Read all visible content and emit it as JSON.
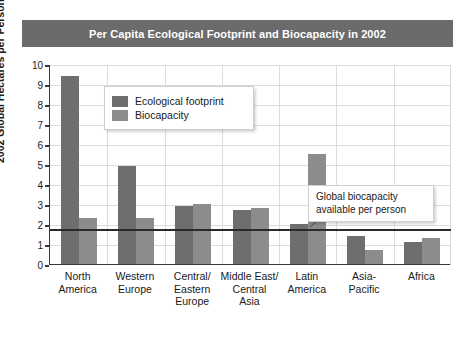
{
  "chart_data": {
    "type": "bar",
    "title": "Per Capita Ecological Footprint and Biocapacity in 2002",
    "xlabel": "",
    "ylabel": "2002 Global Hectares per Person",
    "ylim": [
      0,
      10
    ],
    "yticks": [
      0,
      1,
      2,
      3,
      4,
      5,
      6,
      7,
      8,
      9,
      10
    ],
    "grid": true,
    "legend_position": "upper-left-inside",
    "categories": [
      "North\nAmerica",
      "Western\nEurope",
      "Central/\nEastern\nEurope",
      "Middle East/\nCentral\nAsia",
      "Latin\nAmerica",
      "Asia-\nPacific",
      "Africa"
    ],
    "series": [
      {
        "name": "Ecological footprint",
        "color": "#6e6e6e",
        "values": [
          9.4,
          4.9,
          2.9,
          2.7,
          2.0,
          1.4,
          1.1
        ]
      },
      {
        "name": "Biocapacity",
        "color": "#8c8c8c",
        "values": [
          2.3,
          2.3,
          3.0,
          2.8,
          5.5,
          0.7,
          1.3
        ]
      }
    ],
    "annotations": [
      {
        "text": "Global biocapacity available per person",
        "type": "reference-line-callout",
        "value": 1.8
      }
    ],
    "reference_line": {
      "value": 1.8,
      "color": "#2a2a2a"
    }
  },
  "title": {
    "text": "Per Capita Ecological Footprint and Biocapacity in 2002",
    "background": "#6b6b6b",
    "color": "#ffffff"
  },
  "legend": {
    "items": [
      {
        "label": "Ecological footprint",
        "color": "#6e6e6e"
      },
      {
        "label": "Biocapacity",
        "color": "#8c8c8c"
      }
    ]
  },
  "annotation": {
    "text": "Global biocapacity available per person"
  },
  "axis": {
    "y_title": "2002 Global Hectares per Person",
    "y_ticks": [
      "10",
      "9",
      "8",
      "7",
      "6",
      "5",
      "4",
      "3",
      "2",
      "1",
      "0"
    ]
  }
}
